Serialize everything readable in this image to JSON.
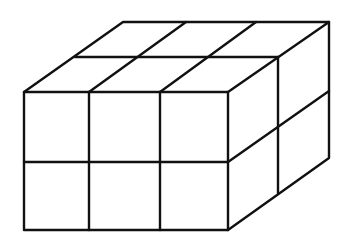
{
  "figure": {
    "dimensions": {
      "length": 3,
      "depth": 2,
      "height": 2
    },
    "cube_count": 12,
    "stroke_color": "#111111",
    "background": "#ffffff"
  }
}
